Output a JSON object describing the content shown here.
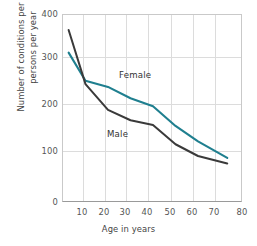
{
  "chart_data": {
    "type": "line",
    "title": "",
    "xlabel": "Age in years",
    "ylabel": "Number of conditions per 100\npersons per year",
    "xlim": [
      0,
      80
    ],
    "ylim": [
      0,
      400
    ],
    "xticks": [
      10,
      20,
      30,
      40,
      50,
      60,
      70,
      80
    ],
    "yticks": [
      0,
      100,
      200,
      300,
      400
    ],
    "grid": true,
    "legend_position": "inline-labels",
    "series": [
      {
        "name": "Female",
        "color": "#1f7f8f",
        "x": [
          2.5,
          10,
          20,
          30,
          40,
          50,
          60,
          73
        ],
        "values": [
          320,
          260,
          247,
          223,
          206,
          164,
          131,
          96
        ]
      },
      {
        "name": "Male",
        "color": "#3a3a3a",
        "x": [
          2.5,
          10,
          20,
          30,
          40,
          50,
          60,
          73
        ],
        "values": [
          368,
          253,
          198,
          176,
          166,
          125,
          100,
          84
        ]
      }
    ],
    "annotations": [
      {
        "text": "Female",
        "x": 33,
        "y": 255
      },
      {
        "text": "Male",
        "x": 27,
        "y": 150
      }
    ]
  },
  "axis": {
    "y_ticks": [
      "400",
      "300",
      "200",
      "100",
      "0"
    ],
    "x_ticks": [
      "10",
      "20",
      "30",
      "40",
      "50",
      "60",
      "70",
      "80"
    ],
    "y_title": "Number of conditions per 100\npersons per year",
    "x_title": "Age in years"
  },
  "labels": {
    "female": "Female",
    "male": "Male"
  },
  "colors": {
    "female_line": "#1f7f8f",
    "male_line": "#3a3a3a",
    "grid": "#dcdcdc",
    "frame": "#c9c9c9",
    "axis": "#9a9a9a",
    "text": "#444444",
    "background": "#ffffff"
  }
}
